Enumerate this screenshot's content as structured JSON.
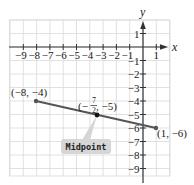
{
  "chart_data": {
    "type": "line",
    "title": "",
    "xlabel": "x",
    "ylabel": "y",
    "xlim": [
      -10,
      2
    ],
    "ylim": [
      -10,
      2
    ],
    "grid": true,
    "x_ticks": [
      -9,
      -8,
      -7,
      -6,
      -5,
      -4,
      -3,
      -2,
      -1,
      1
    ],
    "x_tick_labels": [
      "−9",
      "−8",
      "−7",
      "−6",
      "−5",
      "−4",
      "−3",
      "−2",
      "−1",
      "1"
    ],
    "y_ticks": [
      1,
      -1,
      -2,
      -3,
      -4,
      -5,
      -6,
      -7,
      -8,
      -9
    ],
    "y_tick_labels": [
      "1",
      "−1",
      "−2",
      "−3",
      "−4",
      "−5",
      "−6",
      "−7",
      "−8",
      "−9"
    ],
    "series": [
      {
        "name": "segment",
        "points": [
          {
            "x": -8,
            "y": -4,
            "label": "(−8, −4)"
          },
          {
            "x": -3.5,
            "y": -5,
            "label": "(−7/2, −5)"
          },
          {
            "x": 1,
            "y": -6,
            "label": "(1, −6)"
          }
        ]
      }
    ],
    "annotations": [
      {
        "text": "Midpoint",
        "points_to": {
          "x": -3.5,
          "y": -5
        }
      }
    ]
  },
  "labels": {
    "x_axis": "x",
    "y_axis": "y",
    "point_a": "(−8, −4)",
    "point_b": "(1, −6)",
    "midpoint_open": "(−",
    "midpoint_num": "7",
    "midpoint_den": "2",
    "midpoint_close": ", −5)",
    "callout": "Midpoint"
  },
  "colors": {
    "grid": "#d9d9d9",
    "axis": "#333333",
    "segment": "#555555",
    "point": "#222222",
    "callout_fill": "#d6d6d6"
  }
}
